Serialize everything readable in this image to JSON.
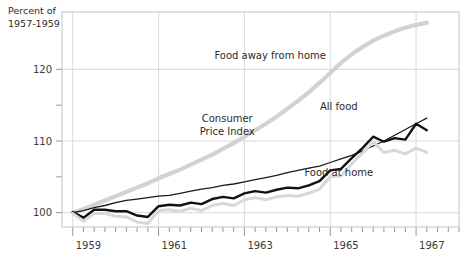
{
  "chart_data": {
    "type": "line",
    "title": "",
    "ylabel": "Percent of 1957-1959",
    "ylabel_line1": "Percent of",
    "ylabel_line2": "1957-1959",
    "xlabel": "",
    "ylim": [
      98,
      128
    ],
    "xlim": [
      1958.75,
      1968.0
    ],
    "yticks_major": [
      100,
      110,
      120
    ],
    "yticks_major_labels": [
      "100",
      "110",
      "120"
    ],
    "yticks_minor": [
      105,
      115
    ],
    "xticks_major": [
      1959,
      1961,
      1963,
      1965,
      1967
    ],
    "xticks_major_labels": [
      "1959",
      "1961",
      "1963",
      "1965",
      "1967"
    ],
    "xticks_minor_step": 0.25,
    "grid": "major-only",
    "legend": "inline-annotations",
    "annotations": [
      {
        "text": "Food away from home",
        "x": 1963.6,
        "y": 121.4
      },
      {
        "text": "Consumer",
        "x": 1962.6,
        "y": 112.6
      },
      {
        "text": "Price  Index",
        "x": 1962.6,
        "y": 110.9
      },
      {
        "text": "All food",
        "x": 1965.2,
        "y": 114.3
      },
      {
        "text": "Food at home",
        "x": 1965.2,
        "y": 105.1
      }
    ],
    "series": [
      {
        "name": "Food away from home",
        "color": "#d2d2d2",
        "width": 4.2,
        "x": [
          1959.0,
          1959.25,
          1959.5,
          1959.75,
          1960.0,
          1960.25,
          1960.5,
          1960.75,
          1961.0,
          1961.25,
          1961.5,
          1961.75,
          1962.0,
          1962.25,
          1962.5,
          1962.75,
          1963.0,
          1963.25,
          1963.5,
          1963.75,
          1964.0,
          1964.25,
          1964.5,
          1964.75,
          1965.0,
          1965.25,
          1965.5,
          1965.75,
          1966.0,
          1966.25,
          1966.5,
          1966.75,
          1967.0,
          1967.25
        ],
        "values": [
          100.0,
          100.5,
          101.1,
          101.7,
          102.3,
          102.9,
          103.5,
          104.1,
          104.8,
          105.4,
          106.0,
          106.7,
          107.4,
          108.1,
          108.9,
          109.7,
          110.6,
          111.5,
          112.4,
          113.4,
          114.5,
          115.6,
          116.8,
          118.1,
          119.5,
          120.9,
          122.1,
          123.1,
          124.0,
          124.7,
          125.3,
          125.8,
          126.2,
          126.5
        ]
      },
      {
        "name": "Consumer Price Index",
        "color": "#1a1a1a",
        "width": 1.3,
        "x": [
          1959.0,
          1959.25,
          1959.5,
          1959.75,
          1960.0,
          1960.25,
          1960.5,
          1960.75,
          1961.0,
          1961.25,
          1961.5,
          1961.75,
          1962.0,
          1962.25,
          1962.5,
          1962.75,
          1963.0,
          1963.25,
          1963.5,
          1963.75,
          1964.0,
          1964.25,
          1964.5,
          1964.75,
          1965.0,
          1965.25,
          1965.5,
          1965.75,
          1966.0,
          1966.25,
          1966.5,
          1966.75,
          1967.0,
          1967.25
        ],
        "values": [
          100.0,
          100.3,
          100.7,
          101.0,
          101.4,
          101.7,
          101.9,
          102.1,
          102.3,
          102.4,
          102.7,
          103.0,
          103.3,
          103.5,
          103.8,
          104.0,
          104.3,
          104.6,
          104.9,
          105.2,
          105.6,
          105.9,
          106.2,
          106.5,
          107.0,
          107.5,
          108.0,
          108.6,
          109.3,
          110.0,
          110.8,
          111.6,
          112.4,
          113.2
        ]
      },
      {
        "name": "All food",
        "color": "#111111",
        "width": 2.4,
        "x": [
          1959.0,
          1959.25,
          1959.5,
          1959.75,
          1960.0,
          1960.25,
          1960.5,
          1960.75,
          1961.0,
          1961.25,
          1961.5,
          1961.75,
          1962.0,
          1962.25,
          1962.5,
          1962.75,
          1963.0,
          1963.25,
          1963.5,
          1963.75,
          1964.0,
          1964.25,
          1964.5,
          1964.75,
          1965.0,
          1965.25,
          1965.5,
          1965.75,
          1966.0,
          1966.25,
          1966.5,
          1966.75,
          1967.0,
          1967.25
        ],
        "values": [
          100.1,
          99.3,
          100.4,
          100.4,
          100.2,
          100.2,
          99.6,
          99.4,
          100.9,
          101.1,
          101.0,
          101.4,
          101.2,
          101.9,
          102.2,
          102.0,
          102.7,
          103.0,
          102.8,
          103.2,
          103.5,
          103.4,
          103.8,
          104.4,
          105.9,
          106.1,
          107.6,
          109.0,
          110.6,
          109.9,
          110.4,
          110.2,
          112.4,
          111.5
        ]
      },
      {
        "name": "Food at home",
        "color": "#d8d8d8",
        "width": 3.0,
        "x": [
          1959.0,
          1959.25,
          1959.5,
          1959.75,
          1960.0,
          1960.25,
          1960.5,
          1960.75,
          1961.0,
          1961.25,
          1961.5,
          1961.75,
          1962.0,
          1962.25,
          1962.5,
          1962.75,
          1963.0,
          1963.25,
          1963.5,
          1963.75,
          1964.0,
          1964.25,
          1964.5,
          1964.75,
          1965.0,
          1965.25,
          1965.5,
          1965.75,
          1966.0,
          1966.25,
          1966.5,
          1966.75,
          1967.0,
          1967.25
        ],
        "values": [
          99.9,
          98.8,
          99.9,
          99.9,
          99.5,
          99.4,
          98.7,
          98.5,
          100.3,
          100.4,
          100.2,
          100.6,
          100.3,
          101.0,
          101.3,
          101.0,
          101.8,
          102.1,
          101.8,
          102.2,
          102.4,
          102.3,
          102.7,
          103.3,
          105.0,
          105.1,
          106.8,
          108.3,
          109.9,
          108.4,
          108.7,
          108.2,
          109.0,
          108.4
        ]
      }
    ]
  },
  "frame": {
    "border_color": "#c9c9c9",
    "grid_color": "#d5d5d5",
    "tick_color": "#8a8a8a",
    "background": "#ffffff"
  }
}
